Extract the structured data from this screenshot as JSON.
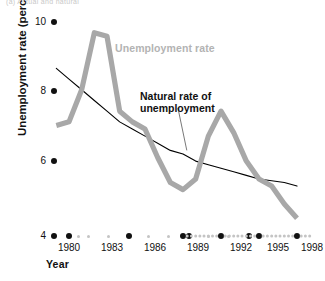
{
  "top_caption": "(a) Actual and natural",
  "axes": {
    "y_title": "Unemployment rate (percentage of labor force)",
    "x_title": "Year",
    "y_ticks": [
      "10",
      "8",
      "6",
      "4"
    ],
    "x_ticks": [
      "1980",
      "1983",
      "1986",
      "1989",
      "1992",
      "1995",
      "1998"
    ]
  },
  "labels": {
    "unemployment_rate": "Unemployment rate",
    "natural_rate_line1": "Natural rate of",
    "natural_rate_line2": "unemployment"
  },
  "colors": {
    "unemployment_rate": "#a8a8a8",
    "natural_rate": "#000000",
    "axis_major_dot": "#111111",
    "axis_minor_dot": "#c4c4c4",
    "background": "#ffffff"
  },
  "chart_data": {
    "type": "line",
    "title": "",
    "xlabel": "Year",
    "ylabel": "Unemployment rate (percentage of labor force)",
    "xlim": [
      1979,
      1999
    ],
    "ylim": [
      4,
      10
    ],
    "grid": false,
    "legend": "inline-annotations",
    "x": [
      1979,
      1980,
      1981,
      1982,
      1983,
      1984,
      1985,
      1986,
      1987,
      1988,
      1989,
      1990,
      1991,
      1992,
      1993,
      1994,
      1995,
      1996,
      1997,
      1998
    ],
    "series": [
      {
        "name": "Unemployment rate",
        "color": "#a8a8a8",
        "values": [
          7.1,
          7.2,
          8.1,
          9.7,
          9.6,
          7.5,
          7.2,
          7.0,
          6.2,
          5.5,
          5.3,
          5.6,
          6.8,
          7.5,
          6.9,
          6.1,
          5.6,
          5.4,
          4.9,
          4.5
        ]
      },
      {
        "name": "Natural rate of unemployment",
        "color": "#000000",
        "values": [
          8.7,
          8.4,
          8.1,
          7.8,
          7.5,
          7.2,
          7.0,
          6.8,
          6.6,
          6.4,
          6.3,
          6.1,
          6.0,
          5.9,
          5.8,
          5.7,
          5.6,
          5.55,
          5.5,
          5.4
        ]
      }
    ],
    "annotations": [
      {
        "text": "Unemployment rate",
        "x": 1984.5,
        "y": 9.0
      },
      {
        "text": "Natural rate of unemployment",
        "x": 1987.5,
        "y": 7.6,
        "leader_to": {
          "x": 1989.3,
          "y": 6.4
        }
      }
    ]
  }
}
